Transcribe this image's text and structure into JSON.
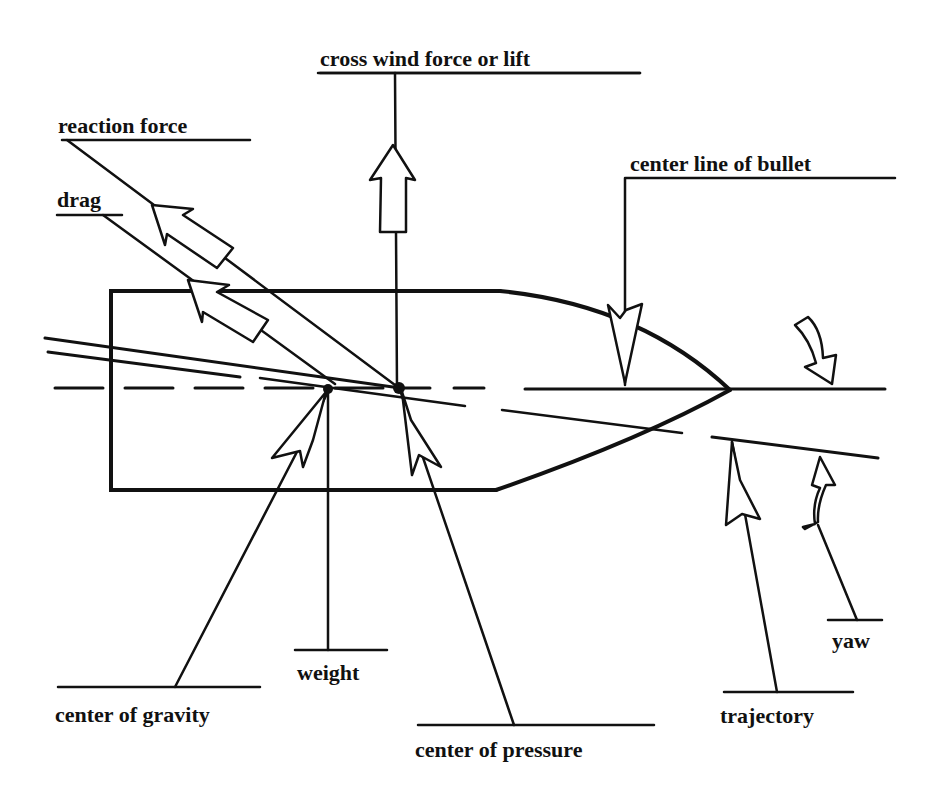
{
  "diagram": {
    "colors": {
      "ink": "#111111",
      "background": "#ffffff"
    },
    "labels": {
      "cross_wind": "cross wind force or lift",
      "reaction_force": "reaction force",
      "drag": "drag",
      "center_line": "center line of bullet",
      "weight": "weight",
      "center_of_gravity": "center of gravity",
      "center_of_pressure": "center of pressure",
      "trajectory": "trajectory",
      "yaw": "yaw"
    }
  }
}
